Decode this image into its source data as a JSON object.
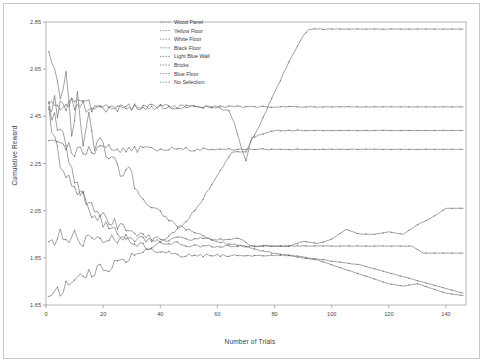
{
  "figure": {
    "background": "#ffffff",
    "frame_color": "#9a9a9a"
  },
  "chart_data": {
    "type": "line",
    "title": "",
    "xlabel": "Number of Trials",
    "ylabel": "Cumulative Reward",
    "xlim": [
      0,
      147
    ],
    "ylim": [
      1.65,
      2.85
    ],
    "xticks": [
      0,
      20,
      40,
      60,
      80,
      100,
      120,
      140
    ],
    "xticklabels": [
      "0",
      "20",
      "40",
      "60",
      "80",
      "100",
      "120",
      "140"
    ],
    "yticks": [
      1.65,
      1.85,
      2.05,
      2.25,
      2.45,
      2.65,
      2.85
    ],
    "yticklabels": [
      "1.65",
      "1.85",
      "2.05",
      "2.25",
      "2.45",
      "2.65",
      "2.85"
    ],
    "grid": false,
    "legend_position": "top-center",
    "line_color": "#555555",
    "marker": "dot",
    "series": [
      {
        "name": "Wood Panel",
        "color": "#555555",
        "x": [
          1,
          2,
          3,
          4,
          6,
          8,
          10,
          12,
          14,
          16,
          18,
          20,
          24,
          28,
          34,
          40,
          46,
          52,
          60,
          70,
          80,
          90,
          100,
          110,
          120,
          130,
          140,
          146
        ],
        "values": [
          2.49,
          2.49,
          2.49,
          2.49,
          2.49,
          2.49,
          2.49,
          2.49,
          2.49,
          2.49,
          2.49,
          2.49,
          2.49,
          2.49,
          2.49,
          2.49,
          2.49,
          2.49,
          2.49,
          2.49,
          2.49,
          2.49,
          2.49,
          2.49,
          2.49,
          2.49,
          2.49,
          2.49
        ]
      },
      {
        "name": "Yellow Floor",
        "color": "#555555",
        "x": [
          1,
          4,
          8,
          12,
          16,
          20,
          24,
          26,
          27,
          28,
          30,
          36,
          44,
          52,
          60,
          64,
          66,
          68,
          70,
          72,
          80,
          90,
          100,
          110,
          120,
          130,
          140,
          146
        ],
        "values": [
          2.49,
          2.49,
          2.49,
          2.49,
          2.49,
          2.49,
          2.49,
          2.49,
          2.49,
          2.49,
          2.49,
          2.49,
          2.49,
          2.49,
          2.49,
          2.47,
          2.42,
          2.33,
          2.26,
          2.36,
          2.39,
          2.39,
          2.39,
          2.39,
          2.39,
          2.39,
          2.39,
          2.39
        ]
      },
      {
        "name": "White Floor",
        "color": "#555555",
        "x": [
          1,
          5,
          10,
          15,
          20,
          25,
          30,
          35,
          40,
          45,
          50,
          55,
          60,
          65,
          70,
          75,
          80,
          85,
          90,
          92,
          100,
          110,
          120,
          130,
          140,
          146
        ],
        "values": [
          1.7,
          1.72,
          1.74,
          1.78,
          1.8,
          1.83,
          1.86,
          1.89,
          1.92,
          1.96,
          2.02,
          2.1,
          2.2,
          2.3,
          2.3,
          2.42,
          2.55,
          2.68,
          2.79,
          2.82,
          2.82,
          2.82,
          2.82,
          2.82,
          2.82,
          2.82
        ]
      },
      {
        "name": "Black Floor",
        "color": "#555555",
        "x": [
          1,
          6,
          12,
          18,
          24,
          30,
          36,
          42,
          48,
          54,
          60,
          66,
          70,
          74,
          80,
          90,
          100,
          110,
          120,
          130,
          140,
          146
        ],
        "values": [
          2.31,
          2.31,
          2.31,
          2.31,
          2.31,
          2.31,
          2.31,
          2.31,
          2.31,
          2.31,
          2.31,
          2.31,
          2.31,
          2.31,
          2.31,
          2.31,
          2.31,
          2.31,
          2.31,
          2.31,
          2.31,
          2.31
        ]
      },
      {
        "name": "Light Blue Wall",
        "color": "#555555",
        "x": [
          1,
          5,
          10,
          16,
          22,
          28,
          34,
          40,
          46,
          52,
          58,
          64,
          68,
          72,
          80,
          90,
          100,
          110,
          120,
          128,
          132,
          140,
          146
        ],
        "values": [
          1.93,
          1.93,
          1.93,
          1.93,
          1.93,
          1.93,
          1.93,
          1.93,
          1.93,
          1.93,
          1.93,
          1.93,
          1.93,
          1.9,
          1.9,
          1.9,
          1.9,
          1.9,
          1.9,
          1.9,
          1.87,
          1.87,
          1.87
        ]
      },
      {
        "name": "Bricks",
        "color": "#555555",
        "x": [
          1,
          3,
          5,
          7,
          9,
          11,
          13,
          15,
          18,
          21,
          24,
          27,
          30,
          34,
          38,
          42,
          46,
          50,
          55,
          60,
          65,
          70,
          75,
          80,
          85,
          90,
          95,
          100,
          105,
          110,
          115,
          120,
          125,
          130,
          135,
          140,
          146
        ],
        "values": [
          2.49,
          2.44,
          2.38,
          2.3,
          2.22,
          2.16,
          2.1,
          2.06,
          2.02,
          1.98,
          1.96,
          1.94,
          1.92,
          1.9,
          1.88,
          1.87,
          1.86,
          1.86,
          1.86,
          1.86,
          1.86,
          1.86,
          1.86,
          1.86,
          1.86,
          1.85,
          1.84,
          1.82,
          1.8,
          1.78,
          1.76,
          1.74,
          1.73,
          1.74,
          1.72,
          1.7,
          1.69
        ]
      },
      {
        "name": "Blue Floor",
        "color": "#555555",
        "x": [
          1,
          4,
          8,
          12,
          16,
          20,
          25,
          30,
          35,
          40,
          45,
          50,
          55,
          60,
          65,
          70,
          75,
          80,
          85,
          90,
          95,
          100,
          105,
          110,
          115,
          120,
          125,
          130,
          135,
          140,
          146
        ],
        "values": [
          2.48,
          2.3,
          2.2,
          2.12,
          2.08,
          2.02,
          1.99,
          1.96,
          1.94,
          1.92,
          1.91,
          1.9,
          1.9,
          1.9,
          1.9,
          1.9,
          1.9,
          1.9,
          1.9,
          1.92,
          1.91,
          1.93,
          1.97,
          1.95,
          1.95,
          1.96,
          1.95,
          1.99,
          2.02,
          2.06,
          2.06
        ]
      },
      {
        "name": "No Selection",
        "color": "#555555",
        "x": [
          1,
          3,
          5,
          7,
          9,
          11,
          13,
          15,
          17,
          19,
          21,
          23,
          26,
          29,
          32,
          36,
          40,
          44,
          48,
          52,
          56,
          60,
          64,
          68,
          72,
          76,
          80,
          86,
          92,
          98,
          104,
          110,
          116,
          122,
          128,
          134,
          140,
          146
        ],
        "values": [
          2.74,
          2.68,
          2.55,
          2.62,
          2.4,
          2.52,
          2.34,
          2.46,
          2.3,
          2.38,
          2.26,
          2.3,
          2.2,
          2.24,
          2.12,
          2.08,
          2.04,
          2.0,
          1.98,
          1.96,
          1.94,
          1.92,
          1.91,
          1.9,
          1.89,
          1.88,
          1.87,
          1.86,
          1.85,
          1.84,
          1.83,
          1.82,
          1.8,
          1.78,
          1.76,
          1.74,
          1.72,
          1.7
        ]
      }
    ]
  },
  "legend": {
    "items": [
      {
        "label": "Wood Panel"
      },
      {
        "label": "Yellow Floor"
      },
      {
        "label": "White Floor"
      },
      {
        "label": "Black Floor"
      },
      {
        "label": "Light Blue Wall"
      },
      {
        "label": "Bricks"
      },
      {
        "label": "Blue Floor"
      },
      {
        "label": "No Selection"
      }
    ]
  }
}
